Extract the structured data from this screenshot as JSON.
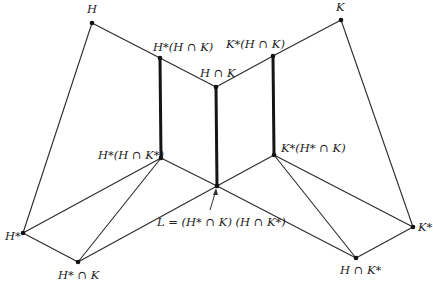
{
  "diagram": {
    "nodes": [
      {
        "id": "H",
        "label": "H",
        "x": 92,
        "y": 23
      },
      {
        "id": "K",
        "label": "K",
        "x": 341,
        "y": 20
      },
      {
        "id": "Hs_HK",
        "label": "H*(H ∩ K)",
        "x": 160,
        "y": 58
      },
      {
        "id": "HK",
        "label": "H ∩ K",
        "x": 216,
        "y": 87
      },
      {
        "id": "Ks_HK",
        "label": "K*(H ∩ K)",
        "x": 273,
        "y": 56
      },
      {
        "id": "Hs_HKs",
        "label": "H*(H ∩ K*)",
        "x": 161,
        "y": 158
      },
      {
        "id": "Ks_HsK",
        "label": "K*(H* ∩ K)",
        "x": 274,
        "y": 155
      },
      {
        "id": "L",
        "label": "L = (H* ∩ K) (H ∩ K*)",
        "x": 217,
        "y": 186
      },
      {
        "id": "Hs",
        "label": "H*",
        "x": 23,
        "y": 233
      },
      {
        "id": "HsK",
        "label": "H* ∩ K",
        "x": 78,
        "y": 262
      },
      {
        "id": "Ks",
        "label": "K*",
        "x": 413,
        "y": 227
      },
      {
        "id": "HKs",
        "label": "H ∩ K*",
        "x": 356,
        "y": 258
      }
    ],
    "thin_edges": [
      [
        "H",
        "Hs_HK"
      ],
      [
        "Hs_HK",
        "HK"
      ],
      [
        "HK",
        "Ks_HK"
      ],
      [
        "Ks_HK",
        "K"
      ],
      [
        "H",
        "Hs"
      ],
      [
        "K",
        "Ks"
      ],
      [
        "Hs",
        "Hs_HKs"
      ],
      [
        "Hs",
        "HsK"
      ],
      [
        "HsK",
        "Hs_HKs"
      ],
      [
        "HsK",
        "L"
      ],
      [
        "Hs_HKs",
        "L"
      ],
      [
        "Ks_HsK",
        "L"
      ],
      [
        "L",
        "HKs"
      ],
      [
        "Ks_HsK",
        "HKs"
      ],
      [
        "Ks_HsK",
        "Ks"
      ],
      [
        "HKs",
        "Ks"
      ]
    ],
    "thick_edges": [
      [
        "Hs_HK",
        "Hs_HKs"
      ],
      [
        "HK",
        "L"
      ],
      [
        "Ks_HK",
        "Ks_HsK"
      ]
    ]
  }
}
